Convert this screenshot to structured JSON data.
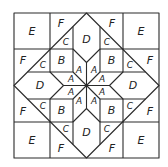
{
  "diagram": {
    "type": "quilt-block tessellation",
    "labels": {
      "E": "E",
      "F": "F",
      "D": "D",
      "C": "C",
      "B": "B",
      "A": "A"
    },
    "pieces": {
      "E_count": 4,
      "F_count": 8,
      "C_count": 8,
      "D_count": 4,
      "B_count": 4,
      "A_count": 8
    },
    "colors": {
      "line": "#2b2b2b",
      "background": "#ffffff",
      "text": "#222222"
    }
  }
}
